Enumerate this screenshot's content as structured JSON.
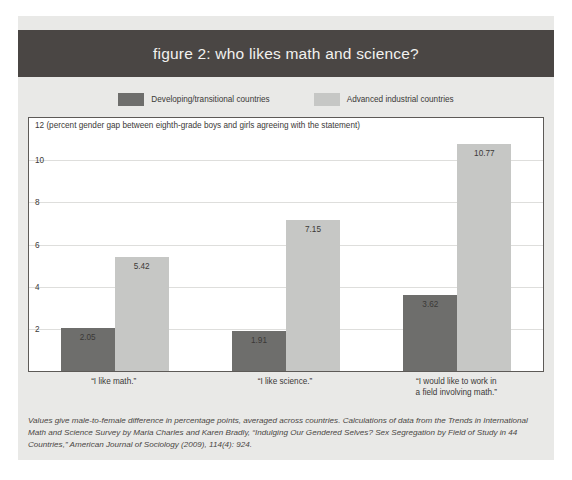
{
  "figure": {
    "title": "figure 2: who likes math and science?",
    "footnote": "Values give male-to-female difference in percentage points, averaged across countries. Calculations of data from the Trends in International Math and Science Survey by Maria Charles and Karen Bradly, “Indulging Our Gendered Selves? Sex Segregation by Field of Study in 44 Countries,” American Journal of Sociology (2009), 114(4): 924."
  },
  "colors": {
    "banner": "#4a4644",
    "card_background": "#e9e9e7",
    "series_developing": "#6e6e6c",
    "series_advanced": "#c6c7c5",
    "gridline": "#dededc",
    "axis": "#5d5a57"
  },
  "chart_data": {
    "type": "bar",
    "title": "figure 2: who likes math and science?",
    "ylabel": "(percent gender gap between eighth-grade boys and girls agreeing with the statement)",
    "axis_caption": "12 (percent gender gap between eighth-grade boys and girls agreeing with the statement)",
    "xlabel": "",
    "ylim": [
      0,
      12
    ],
    "yticks": [
      12,
      10,
      8,
      6,
      4,
      2
    ],
    "ytick_labels": [
      "12",
      "10",
      "8",
      "6",
      "4",
      "2"
    ],
    "grid": true,
    "legend_position": "top",
    "categories": [
      "“I like math.”",
      "“I like science.”",
      "“I would like to work in\na field involving math.”"
    ],
    "series": [
      {
        "name": "Developing/transitional countries",
        "color": "#6e6e6c",
        "values": [
          2.05,
          1.91,
          3.62
        ],
        "value_labels": [
          "2.05",
          "1.91",
          "3.62"
        ]
      },
      {
        "name": "Advanced industrial countries",
        "color": "#c6c7c5",
        "values": [
          5.42,
          7.15,
          10.77
        ],
        "value_labels": [
          "5.42",
          "7.15",
          "10.77"
        ]
      }
    ]
  }
}
